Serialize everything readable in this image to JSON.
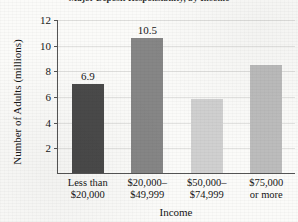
{
  "chart_data": {
    "type": "bar",
    "title": "Major Deposit Responsibility, by Income",
    "xlabel": "Income",
    "ylabel": "Number of Adults (millions)",
    "categories": [
      "Less than $20,000",
      "$20,000–$49,999",
      "$50,000–$74,999",
      "$75,000 or more"
    ],
    "category_lines": [
      [
        "Less than",
        "$20,000"
      ],
      [
        "$20,000–",
        "$49,999"
      ],
      [
        "$50,000–",
        "$74,999"
      ],
      [
        "$75,000",
        "or more"
      ]
    ],
    "values": [
      6.9,
      10.5,
      5.8,
      8.4
    ],
    "data_labels": [
      "6.9",
      "10.5",
      "",
      ""
    ],
    "bar_colors": [
      "#4a4a4a",
      "#868686",
      "#d0d0d0",
      "#bcbcbc"
    ],
    "ylim": [
      0,
      12
    ],
    "yticks": [
      2,
      4,
      6,
      8,
      10,
      12
    ],
    "ytick_labels": [
      "2",
      "4",
      "6",
      "8",
      "10",
      "12"
    ],
    "grid": true,
    "legend": "none"
  }
}
